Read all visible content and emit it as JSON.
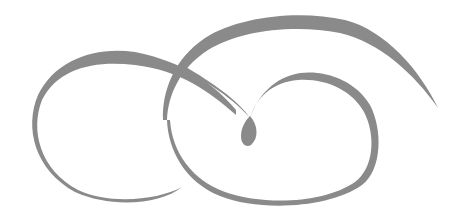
{
  "image": {
    "type": "decorative-flourish",
    "description": "Calligraphic swirl ornament with two interlocking loops and a central teardrop",
    "colors": {
      "background": "#ffffff",
      "stroke": "#8a8a8a"
    }
  }
}
